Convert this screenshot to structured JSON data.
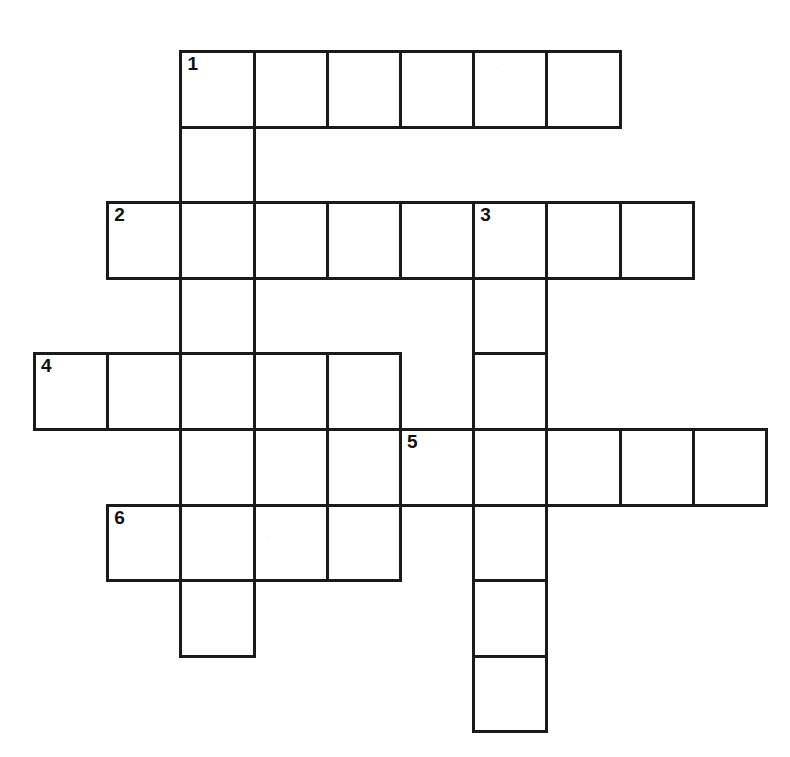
{
  "document": {
    "type": "crossword-puzzle-grid",
    "title": "",
    "background_color": "#ffffff",
    "line_color": "#1a1a1a",
    "number_color": "#111111"
  },
  "grid": {
    "columns": 11,
    "rows": 9,
    "cell_width": 73.2,
    "cell_height": 75.6,
    "origin_x": 33,
    "origin_y": 50,
    "border_width": 3
  },
  "clue_numbers": [
    {
      "label": "1",
      "col": 2,
      "row": 0
    },
    {
      "label": "2",
      "col": 1,
      "row": 2
    },
    {
      "label": "3",
      "col": 6,
      "row": 2
    },
    {
      "label": "4",
      "col": 0,
      "row": 4
    },
    {
      "label": "5",
      "col": 5,
      "row": 5
    },
    {
      "label": "6",
      "col": 1,
      "row": 6
    }
  ],
  "entries": {
    "across": [
      {
        "number": "1",
        "row": 0,
        "start_col": 2,
        "length": 6,
        "answer": ""
      },
      {
        "number": "2",
        "row": 2,
        "start_col": 1,
        "length": 8,
        "answer": ""
      },
      {
        "number": "4",
        "row": 4,
        "start_col": 0,
        "length": 5,
        "answer": ""
      },
      {
        "number": "5",
        "row": 5,
        "start_col": 5,
        "length": 5,
        "answer": ""
      },
      {
        "number": "6",
        "row": 6,
        "start_col": 1,
        "length": 4,
        "answer": ""
      }
    ],
    "down": [
      {
        "number": "1",
        "col": 2,
        "start_row": 0,
        "length": 8,
        "answer": ""
      },
      {
        "number": "3",
        "col": 6,
        "start_row": 2,
        "length": 7,
        "answer": ""
      }
    ]
  },
  "cells": [
    {
      "col": 2,
      "row": 0,
      "number": "1",
      "letter": ""
    },
    {
      "col": 3,
      "row": 0,
      "number": "",
      "letter": ""
    },
    {
      "col": 4,
      "row": 0,
      "number": "",
      "letter": ""
    },
    {
      "col": 5,
      "row": 0,
      "number": "",
      "letter": ""
    },
    {
      "col": 6,
      "row": 0,
      "number": "",
      "letter": ""
    },
    {
      "col": 7,
      "row": 0,
      "number": "",
      "letter": ""
    },
    {
      "col": 2,
      "row": 1,
      "number": "",
      "letter": ""
    },
    {
      "col": 1,
      "row": 2,
      "number": "2",
      "letter": ""
    },
    {
      "col": 2,
      "row": 2,
      "number": "",
      "letter": ""
    },
    {
      "col": 3,
      "row": 2,
      "number": "",
      "letter": ""
    },
    {
      "col": 4,
      "row": 2,
      "number": "",
      "letter": ""
    },
    {
      "col": 5,
      "row": 2,
      "number": "",
      "letter": ""
    },
    {
      "col": 6,
      "row": 2,
      "number": "3",
      "letter": ""
    },
    {
      "col": 7,
      "row": 2,
      "number": "",
      "letter": ""
    },
    {
      "col": 8,
      "row": 2,
      "number": "",
      "letter": ""
    },
    {
      "col": 2,
      "row": 3,
      "number": "",
      "letter": ""
    },
    {
      "col": 6,
      "row": 3,
      "number": "",
      "letter": ""
    },
    {
      "col": 0,
      "row": 4,
      "number": "4",
      "letter": ""
    },
    {
      "col": 1,
      "row": 4,
      "number": "",
      "letter": ""
    },
    {
      "col": 2,
      "row": 4,
      "number": "",
      "letter": ""
    },
    {
      "col": 3,
      "row": 4,
      "number": "",
      "letter": ""
    },
    {
      "col": 4,
      "row": 4,
      "number": "",
      "letter": ""
    },
    {
      "col": 6,
      "row": 4,
      "number": "",
      "letter": ""
    },
    {
      "col": 2,
      "row": 5,
      "number": "",
      "letter": ""
    },
    {
      "col": 3,
      "row": 5,
      "number": "",
      "letter": ""
    },
    {
      "col": 5,
      "row": 5,
      "number": "5",
      "letter": ""
    },
    {
      "col": 6,
      "row": 5,
      "number": "",
      "letter": ""
    },
    {
      "col": 7,
      "row": 5,
      "number": "",
      "letter": ""
    },
    {
      "col": 8,
      "row": 5,
      "number": "",
      "letter": ""
    },
    {
      "col": 9,
      "row": 5,
      "number": "",
      "letter": ""
    },
    {
      "col": 1,
      "row": 6,
      "number": "6",
      "letter": ""
    },
    {
      "col": 2,
      "row": 6,
      "number": "",
      "letter": ""
    },
    {
      "col": 3,
      "row": 6,
      "number": "",
      "letter": ""
    },
    {
      "col": 4,
      "row": 6,
      "number": "",
      "letter": ""
    },
    {
      "col": 6,
      "row": 6,
      "number": "",
      "letter": ""
    },
    {
      "col": 2,
      "row": 7,
      "number": "",
      "letter": ""
    },
    {
      "col": 6,
      "row": 7,
      "number": "",
      "letter": ""
    },
    {
      "col": 6,
      "row": 8,
      "number": "",
      "letter": ""
    }
  ]
}
